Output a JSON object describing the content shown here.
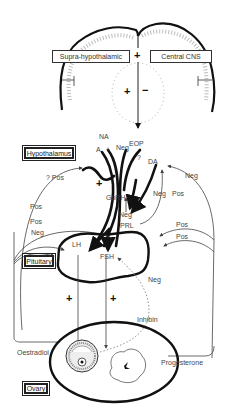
{
  "diagram": {
    "brain": {
      "boxes": {
        "supra_hypothalamic": "Supra-hypothalamic",
        "central_cns": "Central CNS"
      },
      "signs": {
        "top_plus": "+",
        "inner_plus": "+",
        "inner_minus": "−"
      }
    },
    "hypothalamus": {
      "box": "Hypothalamus",
      "labels": {
        "na": "NA",
        "a": "A",
        "a_plus": "+",
        "neg_top": "Neg",
        "eop": "EOP",
        "question": "?",
        "da": "DA",
        "q_pos": "? Pos",
        "plus_left": "+",
        "gnrh": "GnRH",
        "neg_gnrh": "Neg",
        "prl": "PRL",
        "neg_da": "Neg",
        "pos_da": "Pos",
        "neg_right": "Neg"
      }
    },
    "pituitary": {
      "box": "Pituitary",
      "labels": {
        "pos_left_1": "Pos",
        "pos_left_2": "Pos",
        "neg_left": "Neg",
        "pos_right_1": "Pos",
        "pos_right_2": "Pos",
        "lh": "LH",
        "fsh": "FSH",
        "neg_fsh": "Neg"
      }
    },
    "gonadotropin_effects": {
      "lh_plus": "+",
      "fsh_plus": "+"
    },
    "ovary": {
      "box": "Ovary",
      "labels": {
        "oestradiol": "Oestradiol",
        "progesterone": "Progesterone",
        "inhibin": "Inhibin"
      }
    }
  }
}
